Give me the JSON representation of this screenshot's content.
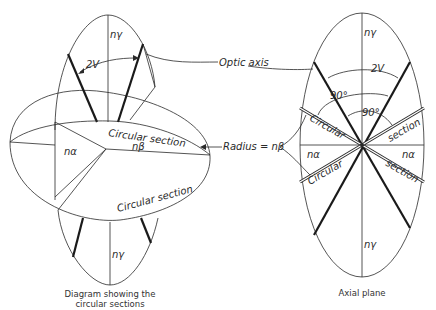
{
  "left_diagram": {
    "caption_line1": "Diagram showing the",
    "caption_line2": "circular sections",
    "labels": {
      "n_gamma_top": "nγ",
      "two_v": "2V",
      "circular_section_top": "Circular section",
      "n_beta": "nβ",
      "n_alpha": "nα",
      "circular_section_bottom": "Circular section",
      "n_gamma_bottom": "nγ"
    }
  },
  "callouts": {
    "optic_axis": "Optic axis",
    "radius": "Radius = nβ"
  },
  "right_diagram": {
    "caption": "Axial plane",
    "labels": {
      "n_gamma_top": "nγ",
      "two_v": "2V",
      "ninety_outer": "90°",
      "ninety_inner": "90°",
      "circular_left_top": "Circular",
      "section_right_top": "section",
      "n_alpha_left": "nα",
      "n_alpha_right": "nα",
      "circular_left_bottom": "Circular",
      "section_right_bottom": "section",
      "n_gamma_bottom": "nγ"
    }
  }
}
